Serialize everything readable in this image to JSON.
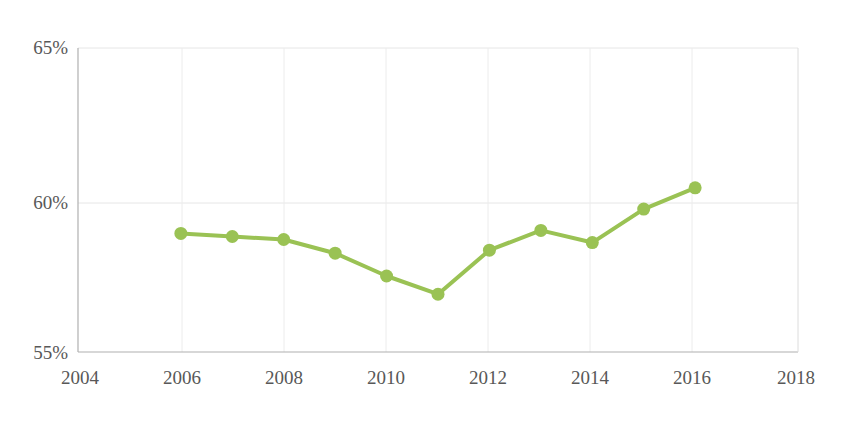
{
  "chart_data": {
    "type": "line",
    "title": "",
    "subtitle": "",
    "xlabel": "",
    "ylabel": "",
    "x": [
      2006,
      2007,
      2008,
      2009,
      2010,
      2011,
      2012,
      2013,
      2014,
      2015,
      2016
    ],
    "values": [
      58.9,
      58.8,
      58.7,
      58.25,
      57.5,
      56.9,
      58.35,
      59.0,
      58.6,
      59.7,
      60.4
    ],
    "series": [
      {
        "name": "",
        "color": "#9ac254",
        "values": [
          58.9,
          58.8,
          58.7,
          58.25,
          57.5,
          56.9,
          58.35,
          59.0,
          58.6,
          59.7,
          60.4
        ]
      }
    ],
    "xlim": [
      2004,
      2018
    ],
    "ylim": [
      55,
      65
    ],
    "x_ticks": [
      2004,
      2006,
      2008,
      2010,
      2012,
      2014,
      2016,
      2018
    ],
    "x_tick_labels": [
      "2004",
      "2006",
      "2008",
      "2010",
      "2012",
      "2014",
      "2016",
      "2018"
    ],
    "y_ticks": [
      55,
      60,
      65
    ],
    "y_tick_labels": [
      "55%",
      "60%",
      "65%"
    ],
    "grid": true,
    "legend": null,
    "legend_position": "none",
    "annotations": []
  },
  "axis": {
    "y_labels": {
      "top": "65%",
      "middle": "60%",
      "bottom": "55%"
    },
    "x_labels": {
      "t0": "2004",
      "t1": "2006",
      "t2": "2008",
      "t3": "2010",
      "t4": "2012",
      "t5": "2014",
      "t6": "2016",
      "t7": "2018"
    }
  },
  "style": {
    "line_color": "#9ac254",
    "marker_color": "#9ac254",
    "grid_color": "#e3e3e3",
    "axis_color": "#b5b5b5",
    "tick_text_color": "#585858",
    "background": "#ffffff"
  }
}
